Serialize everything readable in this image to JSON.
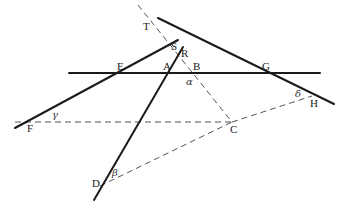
{
  "diagram": {
    "type": "geometry",
    "points": {
      "T": {
        "label": "T",
        "x": 155,
        "y": 22
      },
      "S": {
        "label": "S",
        "x": 178,
        "y": 47
      },
      "R": {
        "label": "R",
        "x": 187,
        "y": 57
      },
      "E": {
        "label": "E",
        "x": 120,
        "y": 73
      },
      "A": {
        "label": "A",
        "x": 167,
        "y": 73
      },
      "B": {
        "label": "B",
        "x": 195,
        "y": 73
      },
      "G": {
        "label": "G",
        "x": 262,
        "y": 73
      },
      "F": {
        "label": "F",
        "x": 15,
        "y": 128
      },
      "C": {
        "label": "C",
        "x": 232,
        "y": 123
      },
      "H": {
        "label": "H",
        "x": 332,
        "y": 104
      },
      "D": {
        "label": "D",
        "x": 94,
        "y": 200
      }
    },
    "angles": {
      "alpha": {
        "symbol": "α",
        "at": "B"
      },
      "beta": {
        "symbol": "β",
        "at": "D"
      },
      "gamma": {
        "symbol": "γ",
        "at": "F"
      },
      "delta": {
        "symbol": "δ",
        "at": "H"
      }
    },
    "solid_lines": [
      {
        "name": "horizontal-line-EG",
        "from": [
          69,
          73
        ],
        "to": [
          320,
          73
        ]
      },
      {
        "name": "line-FS",
        "from": [
          15,
          128
        ],
        "to": [
          178,
          40
        ]
      },
      {
        "name": "line-DR",
        "from": [
          94,
          200
        ],
        "to": [
          183,
          47
        ]
      },
      {
        "name": "line-TH",
        "from": [
          158,
          18
        ],
        "to": [
          334,
          104
        ]
      }
    ],
    "dashed_lines": [
      {
        "name": "dashed-FC",
        "from": [
          15,
          122
        ],
        "to": [
          232,
          122
        ]
      },
      {
        "name": "dashed-TC",
        "from": [
          138,
          5
        ],
        "to": [
          232,
          122
        ]
      },
      {
        "name": "dashed-DC",
        "from": [
          100,
          186
        ],
        "to": [
          232,
          122
        ]
      },
      {
        "name": "dashed-CH",
        "from": [
          232,
          122
        ],
        "to": [
          312,
          96
        ]
      }
    ]
  },
  "caption": {
    "text_visible": false
  }
}
